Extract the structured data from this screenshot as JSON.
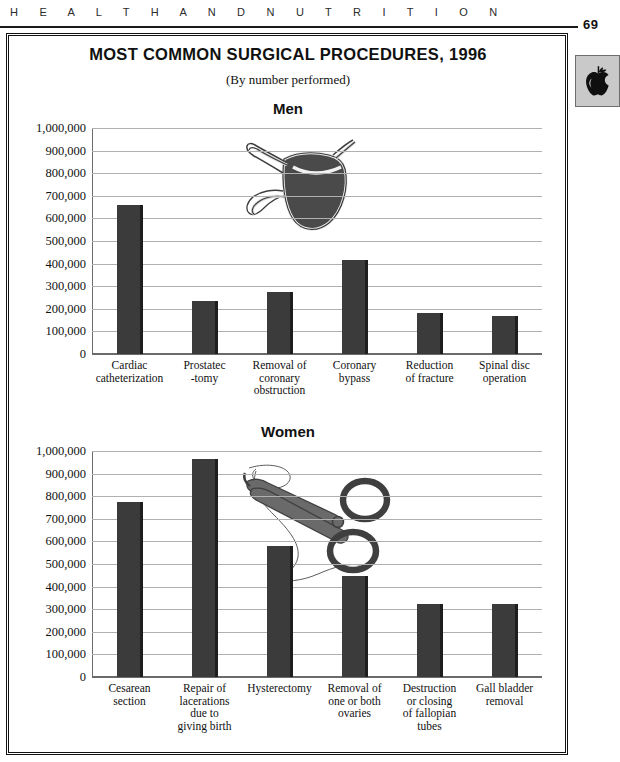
{
  "page": {
    "running_head": "H E A L T H   A N D   N U T R I T I O N",
    "running_head_plain": "HEALTH AND NUTRITION",
    "folio": "69",
    "thumb_tab_icon": "apple-icon"
  },
  "figure": {
    "title": "MOST COMMON SURGICAL PROCEDURES, 1996",
    "subtitle": "(By number performed)"
  },
  "chart_data": [
    {
      "type": "bar",
      "title": "Men",
      "xlabel": "",
      "ylabel": "",
      "ylim": [
        0,
        1000000
      ],
      "ytick_step": 100000,
      "grid": true,
      "legend": "none",
      "tick_labels": [
        "0",
        "100,000",
        "200,000",
        "300,000",
        "400,000",
        "500,000",
        "600,000",
        "700,000",
        "800,000",
        "900,000",
        "1,000,000"
      ],
      "categories": [
        "Cardiac\ncatheterization",
        "Prostatec\n-tomy",
        "Removal of\ncoronary\nobstruction",
        "Coronary\nbypass",
        "Reduction\nof fracture",
        "Spinal disc\noperation"
      ],
      "values": [
        660000,
        235000,
        275000,
        415000,
        180000,
        170000
      ],
      "annotation": "surgical-mask illustration overlapping plot area"
    },
    {
      "type": "bar",
      "title": "Women",
      "xlabel": "",
      "ylabel": "",
      "ylim": [
        0,
        1000000
      ],
      "ytick_step": 100000,
      "grid": true,
      "legend": "none",
      "tick_labels": [
        "0",
        "100,000",
        "200,000",
        "300,000",
        "400,000",
        "500,000",
        "600,000",
        "700,000",
        "800,000",
        "900,000",
        "1,000,000"
      ],
      "categories": [
        "Cesarean\nsection",
        "Repair of\nlacerations\ndue to\ngiving birth",
        "Hysterectomy",
        "Removal of\none or both\novaries",
        "Destruction\nor closing\nof fallopian\ntubes",
        "Gall bladder\nremoval"
      ],
      "values": [
        775000,
        965000,
        580000,
        445000,
        325000,
        325000
      ],
      "annotation": "surgical forceps and suture thread illustration overlapping plot area"
    }
  ],
  "colors": {
    "bar_fill": "#3b3b3b",
    "bar_shadow": "#1e1e1e",
    "gridline": "#b0b0b0",
    "axis": "#6b6b6b",
    "tab_background": "#c9c9c9",
    "text": "#111111"
  }
}
